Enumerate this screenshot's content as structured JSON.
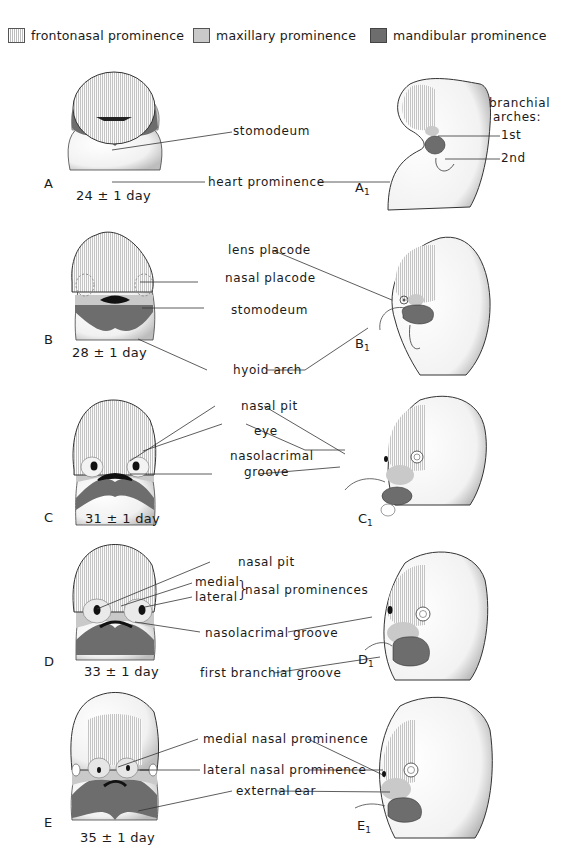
{
  "legend": [
    {
      "label": "frontonasal prominence",
      "swatch": "vertical-hatch",
      "color": "#d8d8d8"
    },
    {
      "label": "maxillary prominence",
      "swatch": "light-gray",
      "color": "#c9c9c9"
    },
    {
      "label": "mandibular prominence",
      "swatch": "dark-gray",
      "color": "#6d6d6d"
    }
  ],
  "panels": [
    {
      "letter": "A",
      "side_letter": "A",
      "side_sub": "1",
      "age": "24 ± 1 day",
      "labels": [
        "stomodeum",
        "heart prominence"
      ],
      "side_labels": {
        "title1": "branchial",
        "title2": "arches:",
        "first": "1st",
        "second": "2nd"
      }
    },
    {
      "letter": "B",
      "side_letter": "B",
      "side_sub": "1",
      "age": "28 ± 1 day",
      "labels": [
        "lens placode",
        "nasal placode",
        "stomodeum",
        "hyoid arch"
      ]
    },
    {
      "letter": "C",
      "side_letter": "C",
      "side_sub": "1",
      "age": "31 ± 1 day",
      "labels": [
        "nasal pit",
        "eye",
        "nasolacrimal",
        "groove"
      ]
    },
    {
      "letter": "D",
      "side_letter": "D",
      "side_sub": "1",
      "age": "33 ± 1 day",
      "labels": [
        "nasal pit",
        "medial",
        "lateral",
        "nasal prominences",
        "nasolacrimal groove",
        "first branchial groove"
      ]
    },
    {
      "letter": "E",
      "side_letter": "E",
      "side_sub": "1",
      "age": "35 ± 1 day",
      "labels": [
        "medial nasal prominence",
        "lateral nasal prominence",
        "external ear"
      ]
    }
  ],
  "colors": {
    "fronto": "#d8d8d8",
    "maxi": "#c9c9c9",
    "mand": "#6d6d6d",
    "line": "#333333"
  }
}
